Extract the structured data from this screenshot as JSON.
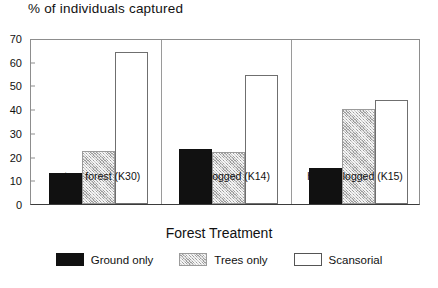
{
  "chart_data": {
    "type": "bar",
    "title": "% of individuals captured",
    "xlabel": "Forest Treatment",
    "ylabel": "",
    "ylim": [
      0,
      70
    ],
    "yticks": [
      0,
      10,
      20,
      30,
      40,
      50,
      60,
      70
    ],
    "grid": false,
    "legend_position": "bottom",
    "categories": [
      "mature forest (K30)",
      "lightly logged (K14)",
      "heavily logged (K15)"
    ],
    "series": [
      {
        "name": "Ground only",
        "fill": "solid",
        "color": "#111111",
        "values": [
          13,
          23,
          15
        ]
      },
      {
        "name": "Trees only",
        "fill": "hatch",
        "color": "#c9c9c9",
        "values": [
          22.5,
          22,
          40
        ]
      },
      {
        "name": "Scansorial",
        "fill": "open",
        "color": "#ffffff",
        "values": [
          64,
          54.5,
          44
        ]
      }
    ]
  }
}
